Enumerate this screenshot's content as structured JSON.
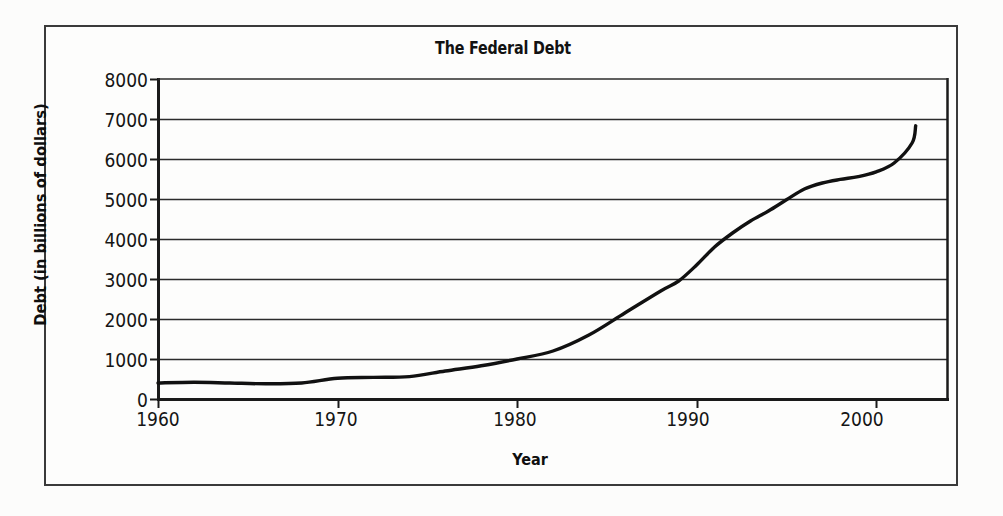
{
  "chart_data": {
    "type": "line",
    "title": "The Federal Debt",
    "xlabel": "Year",
    "ylabel": "Debt (in billions of dollars)",
    "xlim": [
      1960,
      2004
    ],
    "ylim": [
      0,
      8000
    ],
    "grid": true,
    "legend": "none",
    "x_ticks": [
      "1960",
      "1970",
      "1980",
      "1990",
      "2000"
    ],
    "y_ticks": [
      "0",
      "1000",
      "2000",
      "3000",
      "4000",
      "5000",
      "6000",
      "7000",
      "8000"
    ],
    "series": [
      {
        "name": "Federal Debt",
        "color": "#111111",
        "x": [
          1960,
          1962,
          1964,
          1966,
          1968,
          1970,
          1972,
          1974,
          1976,
          1978,
          1980,
          1982,
          1984,
          1986,
          1988,
          1989,
          1990,
          1991,
          1992,
          1993,
          1994,
          1995,
          1996,
          1997,
          1998,
          1999,
          2000,
          2001,
          2002,
          2002.2
        ],
        "values": [
          400,
          420,
          400,
          380,
          400,
          520,
          540,
          560,
          700,
          830,
          1000,
          1200,
          1600,
          2150,
          2700,
          2950,
          3350,
          3800,
          4150,
          4450,
          4700,
          4980,
          5250,
          5400,
          5490,
          5560,
          5680,
          5900,
          6400,
          6830
        ]
      }
    ]
  },
  "figure": {
    "title": "The Federal Debt",
    "y_axis_title": "Debt (in billions of dollars)",
    "x_axis_title": "Year",
    "y_tick_labels": [
      "8000",
      "7000",
      "6000",
      "5000",
      "4000",
      "3000",
      "2000",
      "1000",
      "0"
    ],
    "x_tick_labels": [
      "1960",
      "1970",
      "1980",
      "1990",
      "2000"
    ]
  },
  "colors": {
    "line": "#111111",
    "axis": "#1a1a1a",
    "grid": "#2b2b2b",
    "frame": "#3a3a3a",
    "page_background": "#fcfcfb"
  }
}
